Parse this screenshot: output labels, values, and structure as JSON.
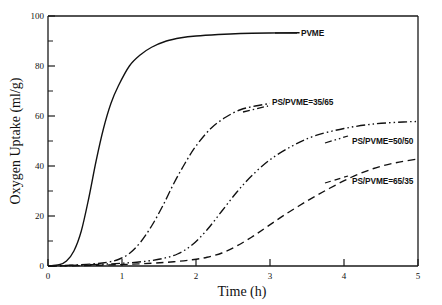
{
  "chart_data": {
    "type": "line",
    "title": "",
    "xlabel": "Time (h)",
    "ylabel": "Oxygen Uptake (ml/g)",
    "xlim": [
      0,
      5
    ],
    "ylim": [
      0,
      100
    ],
    "xticks": [
      "0",
      "1",
      "2",
      "3",
      "4",
      "5"
    ],
    "xtick_values": [
      0,
      1,
      2,
      3,
      4,
      5
    ],
    "yticks": [
      "0",
      "20",
      "40",
      "60",
      "80",
      "100"
    ],
    "ytick_values": [
      0,
      20,
      40,
      60,
      80,
      100
    ],
    "grid": false,
    "legend_position": "inline-annotations",
    "series": [
      {
        "name": "PVME",
        "label": "PVME",
        "linestyle": "solid",
        "x": [
          0,
          0.15,
          0.25,
          0.35,
          0.45,
          0.55,
          0.65,
          0.75,
          0.85,
          0.95,
          1.1,
          1.25,
          1.4,
          1.6,
          1.8,
          2.0,
          2.3,
          2.6,
          3.0,
          3.4
        ],
        "values": [
          0,
          0.5,
          2,
          6,
          14,
          27,
          42,
          55,
          65,
          72,
          80,
          84.5,
          87.5,
          90,
          91.3,
          92,
          92.6,
          93,
          93.2,
          93.3
        ]
      },
      {
        "name": "PS/PVME=35/65",
        "label": "PS/PVME=35/65",
        "linestyle": "dashdot",
        "x": [
          0,
          0.3,
          0.6,
          0.8,
          0.95,
          1.1,
          1.25,
          1.4,
          1.55,
          1.7,
          1.85,
          2.0,
          2.2,
          2.4,
          2.6,
          2.8,
          3.0
        ],
        "values": [
          0,
          0.3,
          0.8,
          1.5,
          2.6,
          5,
          9.5,
          16,
          24,
          33,
          41,
          48,
          55,
          59.5,
          62.5,
          64,
          65
        ]
      },
      {
        "name": "PS/PVME=50/50",
        "label": "PS/PVME=50/50",
        "linestyle": "dashdotdot",
        "x": [
          0,
          0.4,
          0.8,
          1.1,
          1.35,
          1.55,
          1.75,
          1.95,
          2.15,
          2.35,
          2.55,
          2.75,
          3.0,
          3.3,
          3.6,
          4.0,
          4.4,
          4.8,
          5.0
        ],
        "values": [
          0,
          0.3,
          0.8,
          1.3,
          2.0,
          3.0,
          4.8,
          8.5,
          14.5,
          22,
          29.5,
          36,
          42.5,
          48,
          52,
          55,
          56.8,
          57.6,
          57.8
        ]
      },
      {
        "name": "PS/PVME=65/35",
        "label": "PS/PVME=65/35",
        "linestyle": "dashed",
        "x": [
          0,
          0.5,
          1.0,
          1.4,
          1.7,
          1.95,
          2.15,
          2.35,
          2.55,
          2.75,
          2.95,
          3.2,
          3.5,
          3.8,
          4.1,
          4.4,
          4.7,
          5.0
        ],
        "values": [
          0,
          0.2,
          0.6,
          1.1,
          1.7,
          2.5,
          3.5,
          5.2,
          8,
          11.5,
          15.5,
          20.5,
          26,
          31,
          35.5,
          39,
          41.3,
          42.8
        ]
      }
    ],
    "annotations": [
      {
        "text": "PVME",
        "x": 3.55,
        "y": 92
      },
      {
        "text": "PS/PVME=35/65",
        "x": 3.12,
        "y": 66
      },
      {
        "text": "PS/PVME=50/50",
        "x": 4.0,
        "y": 51
      },
      {
        "text": "PS/PVME=65/35",
        "x": 4.0,
        "y": 35.5
      }
    ]
  },
  "colors": {
    "line": "#111111",
    "axis": "#1a1a1a",
    "background": "#ffffff"
  }
}
